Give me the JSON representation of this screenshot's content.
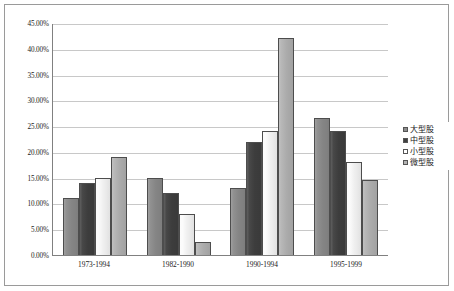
{
  "chart_data": {
    "type": "bar",
    "title": "",
    "subtitle": "",
    "xlabel": "",
    "ylabel": "",
    "categories": [
      "1973-1994",
      "1982-1990",
      "1990-1994",
      "1995-1999"
    ],
    "series": [
      {
        "name": "大型股",
        "color": "#8c8c8c",
        "values": [
          11.0,
          15.0,
          13.0,
          26.5
        ]
      },
      {
        "name": "中型股",
        "color": "#404040",
        "values": [
          14.0,
          12.0,
          22.0,
          24.0
        ]
      },
      {
        "name": "小型股",
        "color": "#ffffff",
        "values": [
          15.0,
          8.0,
          24.0,
          18.0
        ]
      },
      {
        "name": "微型股",
        "color": "#b4b4b4",
        "values": [
          19.0,
          2.5,
          42.0,
          14.5
        ]
      }
    ],
    "ylim": [
      0,
      45
    ],
    "ytick_step": 5,
    "ytick_labels": [
      "45.00%",
      "40.00%",
      "35.00%",
      "30.00%",
      "25.00%",
      "20.00%",
      "15.00%",
      "10.00%",
      "5.00%",
      "0.00%"
    ],
    "ytick_values": [
      45,
      40,
      35,
      30,
      25,
      20,
      15,
      10,
      5,
      0
    ],
    "grid": true,
    "grid_axis": "y",
    "legend_position": "right"
  }
}
